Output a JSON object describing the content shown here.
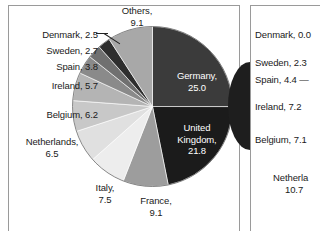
{
  "figure": {
    "panels": [
      {
        "id": "left",
        "name": "pie-chart-panel-left"
      },
      {
        "id": "right",
        "name": "pie-chart-panel-right"
      }
    ]
  },
  "chart_data": [
    {
      "type": "pie",
      "title": "",
      "panel": "left",
      "legend_position": "callout-labels",
      "categories": [
        "Germany",
        "United Kingdom",
        "France",
        "Italy",
        "Netherlands",
        "Belgium",
        "Ireland",
        "Spain",
        "Sweden",
        "Denmark",
        "Others"
      ],
      "values": [
        25.0,
        21.8,
        9.1,
        7.5,
        6.5,
        6.2,
        5.7,
        3.8,
        2.7,
        2.5,
        9.1
      ],
      "colors": [
        "#3b3b3b",
        "#1b1b1b",
        "#9d9d9d",
        "#ededed",
        "#e0e0e0",
        "#c8c8c8",
        "#b4b4b4",
        "#8a8a8a",
        "#707070",
        "#2e2e2e",
        "#a8a8a8"
      ],
      "start_angle_deg": 0,
      "direction": "clockwise",
      "labels": [
        {
          "name": "Germany",
          "text": "Germany,",
          "value": "25.0",
          "placement": "inside"
        },
        {
          "name": "United Kingdom",
          "text": "United",
          "text2": "Kingdom,",
          "value": "21.8",
          "placement": "inside"
        },
        {
          "name": "France",
          "text": "France,",
          "value": "9.1",
          "placement": "outside"
        },
        {
          "name": "Italy",
          "text": "Italy,",
          "value": "7.5",
          "placement": "outside"
        },
        {
          "name": "Netherlands",
          "text": "Netherlands,",
          "value": "6.5",
          "placement": "outside"
        },
        {
          "name": "Belgium",
          "text": "Belgium, 6.2",
          "value": "6.2",
          "placement": "outside"
        },
        {
          "name": "Ireland",
          "text": "Ireland, 5.7",
          "value": "5.7",
          "placement": "outside"
        },
        {
          "name": "Spain",
          "text": "Spain, 3.8",
          "value": "3.8",
          "placement": "outside"
        },
        {
          "name": "Sweden",
          "text": "Sweden, 2.7",
          "value": "2.7",
          "placement": "outside"
        },
        {
          "name": "Denmark",
          "text": "Denmark, 2.5",
          "value": "2.5",
          "placement": "outside-leader"
        },
        {
          "name": "Others",
          "text": "Others,",
          "value": "9.1",
          "placement": "outside"
        }
      ]
    },
    {
      "type": "pie",
      "title": "",
      "panel": "right",
      "note": "second pie chart, cropped at image edge; only callout labels visible",
      "categories": [
        "Denmark",
        "Sweden",
        "Spain",
        "Ireland",
        "Belgium",
        "Netherlands"
      ],
      "values": [
        0.0,
        2.3,
        4.4,
        7.2,
        7.1,
        10.7
      ],
      "labels": [
        {
          "name": "Denmark",
          "text": "Denmark, 0.0"
        },
        {
          "name": "Sweden",
          "text": "Sweden, 2.3"
        },
        {
          "name": "Spain",
          "text": "Spain, 4.4 —"
        },
        {
          "name": "Ireland",
          "text": "Ireland, 7.2"
        },
        {
          "name": "Belgium",
          "text": "Belgium, 7.1"
        },
        {
          "name": "Netherlands",
          "text": "Netherla",
          "value": "10.7"
        }
      ]
    }
  ],
  "left_panel": {
    "others": {
      "line1": "Others,",
      "line2": "9.1"
    },
    "denmark": {
      "line1": "Denmark, 2.5"
    },
    "sweden": {
      "line1": "Sweden, 2.7"
    },
    "spain": {
      "line1": "Spain, 3.8"
    },
    "ireland": {
      "line1": "Ireland, 5.7"
    },
    "belgium": {
      "line1": "Belgium, 6.2"
    },
    "netherlands": {
      "line1": "Netherlands,",
      "line2": "6.5"
    },
    "italy": {
      "line1": "Italy,",
      "line2": "7.5"
    },
    "france": {
      "line1": "France,",
      "line2": "9.1"
    },
    "germany": {
      "line1": "Germany,",
      "line2": "25.0"
    },
    "uk": {
      "line1": "United",
      "line2": "Kingdom,",
      "line3": "21.8"
    }
  },
  "right_panel": {
    "denmark": {
      "line1": "Denmark, 0.0"
    },
    "sweden": {
      "line1": "Sweden, 2.3"
    },
    "spain": {
      "line1": "Spain, 4.4 —"
    },
    "ireland": {
      "line1": "Ireland, 7.2"
    },
    "belgium": {
      "line1": "Belgium, 7.1"
    },
    "netherlands": {
      "line1": "Netherla",
      "line2": "10.7"
    }
  }
}
